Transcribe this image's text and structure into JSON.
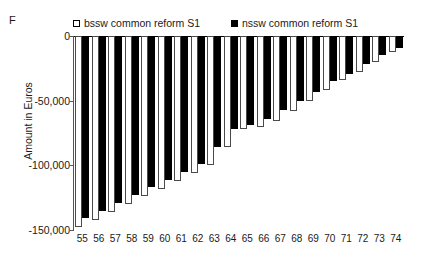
{
  "panel": {
    "letter": "F"
  },
  "legend": {
    "entries": [
      {
        "label": "bssw common reform S1",
        "swatch": "open-square-icon",
        "color": "#ffffff"
      },
      {
        "label": "nssw common reform S1",
        "swatch": "filled-square-icon",
        "color": "#000000"
      }
    ]
  },
  "chart_data": {
    "type": "bar",
    "title": "",
    "subtitle": "",
    "xlabel": "",
    "ylabel": "Amount in Euros",
    "ylim": [
      -150000,
      0
    ],
    "yticks": [
      0,
      -50000,
      -100000,
      -150000
    ],
    "ytick_labels": [
      "0",
      "-50,000",
      "-100,000",
      "-150,000"
    ],
    "grid": false,
    "legend_position": "top",
    "orientation": "vertical-negative",
    "categories": [
      "55",
      "56",
      "57",
      "58",
      "59",
      "60",
      "61",
      "62",
      "63",
      "64",
      "65",
      "66",
      "67",
      "68",
      "69",
      "70",
      "71",
      "72",
      "73",
      "74"
    ],
    "series": [
      {
        "name": "bssw common reform S1",
        "color": "#ffffff",
        "edge_color": "#4a4a4a",
        "values": [
          -148000,
          -142000,
          -136000,
          -130000,
          -124000,
          -118000,
          -112000,
          -106000,
          -100000,
          -86000,
          -72000,
          -70000,
          -66000,
          -58000,
          -50000,
          -42000,
          -34000,
          -28000,
          -20000,
          -12000
        ]
      },
      {
        "name": "nssw common reform S1",
        "color": "#000000",
        "edge_color": "#000000",
        "values": [
          -141000,
          -135000,
          -129000,
          -123000,
          -117000,
          -111000,
          -105000,
          -99000,
          -86000,
          -72000,
          -69000,
          -64000,
          -57000,
          -50000,
          -43000,
          -35000,
          -29000,
          -22000,
          -15000,
          -9000
        ]
      }
    ]
  }
}
